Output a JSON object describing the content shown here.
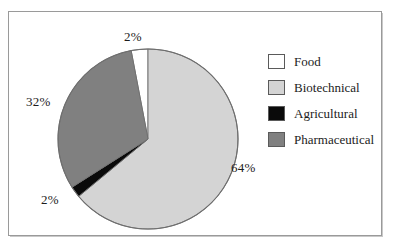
{
  "chart_data": {
    "type": "pie",
    "title": "",
    "subtitle": "",
    "xlabel": "",
    "ylabel": "",
    "legend_position": "right",
    "grid": false,
    "categories": [
      "Food",
      "Biotechnical",
      "Agricultural",
      "Pharmaceutical"
    ],
    "values": [
      2,
      32,
      2,
      64
    ],
    "value_unit": "%",
    "slices": [
      {
        "label": "Food",
        "value": 2,
        "display_value": "2%",
        "color": "#ffffff",
        "start_angle": 349.2,
        "end_angle": 360.0
      },
      {
        "label": "Biotechnical",
        "value": 64,
        "display_value": "64%",
        "color": "#d4d4d4",
        "start_angle": 0.0,
        "end_angle": 230.4
      },
      {
        "label": "Agricultural",
        "value": 2,
        "display_value": "2%",
        "color": "#0a0a0a",
        "start_angle": 230.4,
        "end_angle": 237.6
      },
      {
        "label": "Pharmaceutical",
        "value": 32,
        "display_value": "32%",
        "color": "#808080",
        "start_angle": 237.6,
        "end_angle": 349.2
      }
    ],
    "data_labels": [
      {
        "name": "top",
        "text": "2%",
        "slice": "Food"
      },
      {
        "name": "left",
        "text": "32%",
        "slice": "Pharmaceutical"
      },
      {
        "name": "bottom",
        "text": "2%",
        "slice": "Agricultural"
      },
      {
        "name": "right",
        "text": "64%",
        "slice": "Biotechnical"
      }
    ]
  },
  "legend": {
    "items": [
      {
        "label": "Food",
        "color": "#ffffff"
      },
      {
        "label": "Biotechnical",
        "color": "#d4d4d4"
      },
      {
        "label": "Agricultural",
        "color": "#0a0a0a"
      },
      {
        "label": "Pharmaceutical",
        "color": "#808080"
      }
    ]
  },
  "style": {
    "background": "#ffffff",
    "frame_color": "#9a9a9a",
    "outline_color": "#6e6e6e",
    "text_color": "#1c1c1c"
  }
}
